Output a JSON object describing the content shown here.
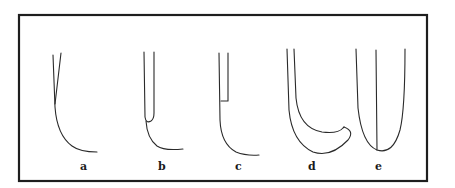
{
  "figure": {
    "type": "line-drawing",
    "frame_color": "#1e1e1e",
    "stroke_color": "#2a2a2a",
    "panels": [
      {
        "id": "a",
        "label": "a",
        "description": "two converging strokes merging into one curve that sweeps right"
      },
      {
        "id": "b",
        "label": "b",
        "description": "narrow U-shape with outer curve sweeping right at the base"
      },
      {
        "id": "c",
        "label": "c",
        "description": "narrow rectangle on top with outer curve sweeping right at the base"
      },
      {
        "id": "d",
        "label": "d",
        "description": "nested curved J-shapes meeting at a point on the right"
      },
      {
        "id": "e",
        "label": "e",
        "description": "U-shape bisected by a vertical center line"
      }
    ]
  }
}
